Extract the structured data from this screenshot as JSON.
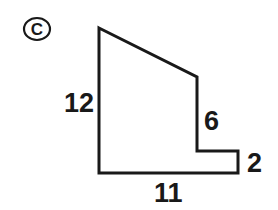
{
  "figure": {
    "part_label": "C",
    "part_label_icon": "circled-letter-badge",
    "stroke_color": "#191919",
    "fill_color": "#ffffff",
    "background_color": "#ffffff",
    "stroke_width": 3
  },
  "labels": {
    "left_side": "12",
    "right_side": "6",
    "right_step": "2",
    "bottom_side": "11"
  },
  "chart_data": {
    "type": "diagram",
    "title": "",
    "shape": "polygon",
    "units": "",
    "vertices": [
      {
        "name": "top-left-apex",
        "x": 99,
        "y": 28
      },
      {
        "name": "slope-end-top-right",
        "x": 197,
        "y": 77
      },
      {
        "name": "step-inner-corner",
        "x": 197,
        "y": 151
      },
      {
        "name": "step-outer-top",
        "x": 238,
        "y": 151
      },
      {
        "name": "bottom-right",
        "x": 238,
        "y": 173
      },
      {
        "name": "bottom-left",
        "x": 99,
        "y": 173
      }
    ],
    "edges": [
      {
        "from": "top-left-apex",
        "to": "slope-end-top-right",
        "label": "",
        "orientation": "slanted"
      },
      {
        "from": "slope-end-top-right",
        "to": "step-inner-corner",
        "label": "6",
        "orientation": "vertical"
      },
      {
        "from": "step-inner-corner",
        "to": "step-outer-top",
        "label": "",
        "orientation": "horizontal"
      },
      {
        "from": "step-outer-top",
        "to": "bottom-right",
        "label": "2",
        "orientation": "vertical"
      },
      {
        "from": "bottom-right",
        "to": "bottom-left",
        "label": "11",
        "orientation": "horizontal"
      },
      {
        "from": "bottom-left",
        "to": "top-left-apex",
        "label": "12",
        "orientation": "vertical"
      }
    ],
    "dimension_labels": [
      {
        "text": "12",
        "edge": "left vertical side",
        "x": 78,
        "y": 103
      },
      {
        "text": "6",
        "edge": "right upper vertical side",
        "x": 211,
        "y": 121
      },
      {
        "text": "2",
        "edge": "right lower vertical side",
        "x": 254,
        "y": 163
      },
      {
        "text": "11",
        "edge": "bottom horizontal side",
        "x": 169,
        "y": 192
      }
    ]
  }
}
